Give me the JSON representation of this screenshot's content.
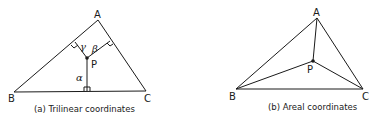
{
  "figures": [
    {
      "id": "a",
      "caption": "(a) Trilinear coordinates",
      "vertices": {
        "A": "A",
        "B": "B",
        "C": "C"
      },
      "point": "P",
      "distances": {
        "to_BC": "α",
        "to_CA": "β",
        "to_AB": "γ"
      }
    },
    {
      "id": "b",
      "caption": "(b) Areal coordinates",
      "vertices": {
        "A": "A",
        "B": "B",
        "C": "C"
      },
      "point": "P"
    }
  ]
}
